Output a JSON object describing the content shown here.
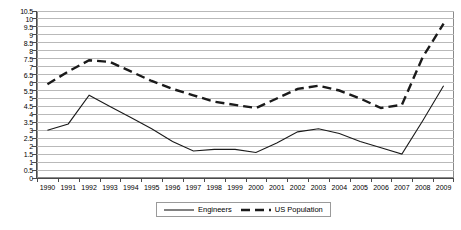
{
  "chart_data": {
    "type": "line",
    "title": "",
    "subtitle": "",
    "xlabel": "",
    "ylabel": "",
    "grid": true,
    "legend_position": "bottom-center",
    "x": [
      "1990",
      "1991",
      "1992",
      "1993",
      "1994",
      "1995",
      "1996",
      "1997",
      "1998",
      "1999",
      "2000",
      "2001",
      "2002",
      "2003",
      "2004",
      "2005",
      "2006",
      "2007",
      "2008",
      "2009"
    ],
    "categories": [
      "1990",
      "1991",
      "1992",
      "1993",
      "1994",
      "1995",
      "1996",
      "1997",
      "1998",
      "1999",
      "2000",
      "2001",
      "2002",
      "2003",
      "2004",
      "2005",
      "2006",
      "2007",
      "2008",
      "2009"
    ],
    "xlim": [
      "1990",
      "2009"
    ],
    "ylim": [
      0,
      10.5
    ],
    "ytick_step": 0.5,
    "yticks": [
      "10.5",
      "10",
      "9.5",
      "9",
      "8.5",
      "8",
      "7.5",
      "7",
      "6.5",
      "6",
      "5.5",
      "5",
      "4.5",
      "4",
      "3.5",
      "3",
      "2.5",
      "2",
      "1.5",
      "1",
      "0.5",
      "0"
    ],
    "ytick_values": [
      10.5,
      10,
      9.5,
      9,
      8.5,
      8,
      7.5,
      7,
      6.5,
      6,
      5.5,
      5,
      4.5,
      4,
      3.5,
      3,
      2.5,
      2,
      1.5,
      1,
      0.5,
      0
    ],
    "series": [
      {
        "name": "Engineers",
        "style": "solid",
        "color": "#1a1a1a",
        "values": [
          3.0,
          3.4,
          5.2,
          4.5,
          3.8,
          3.1,
          2.3,
          1.7,
          1.8,
          1.8,
          1.6,
          2.2,
          2.9,
          3.1,
          2.8,
          2.3,
          1.9,
          1.5,
          3.6,
          5.8
        ]
      },
      {
        "name": "US Population",
        "style": "dashed",
        "color": "#1a1a1a",
        "values": [
          5.9,
          6.7,
          7.4,
          7.3,
          6.7,
          6.1,
          5.6,
          5.2,
          4.8,
          4.6,
          4.4,
          5.0,
          5.6,
          5.8,
          5.5,
          5.0,
          4.4,
          4.6,
          7.6,
          9.7
        ]
      }
    ]
  },
  "legend": {
    "items": [
      {
        "label": "Engineers",
        "style": "solid"
      },
      {
        "label": "US Population",
        "style": "dashed"
      }
    ]
  }
}
